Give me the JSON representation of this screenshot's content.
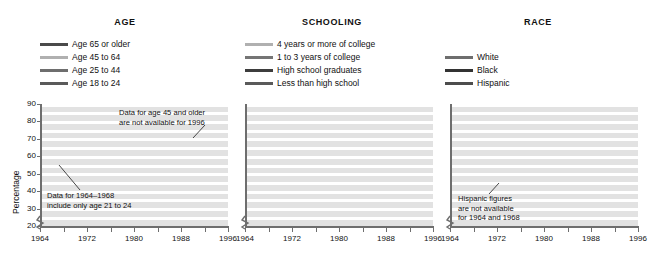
{
  "figure": {
    "ylabel": "Percentage",
    "yticks": [
      20,
      30,
      40,
      50,
      60,
      70,
      80,
      90
    ],
    "xticks": [
      1964,
      1968,
      1972,
      1976,
      1980,
      1984,
      1988,
      1992,
      1996
    ],
    "xtick_labels": [
      "1964",
      "",
      "1972",
      "",
      "1980",
      "",
      "1988",
      "",
      "1996"
    ],
    "colors": {
      "dark": "#444444",
      "darker": "#2e2e2e",
      "mid": "#6b6b6b",
      "light": "#a8a8a8",
      "lighter": "#bdbdbd",
      "plot_bg": "#e2e2e2",
      "gridline": "#ffffff",
      "axis": "#6e6e6e"
    }
  },
  "chart_data": [
    {
      "type": "line",
      "title": "AGE",
      "xlabel": "",
      "ylabel": "Percentage",
      "xlim": [
        1964,
        1996
      ],
      "ylim": [
        20,
        90
      ],
      "grid": true,
      "legend_position": "above-plot",
      "x": [
        1964,
        1968,
        1972,
        1976,
        1980,
        1984,
        1988,
        1992,
        1996
      ],
      "series": [
        {
          "name": "Age 65 or older",
          "color": "#4a4a4a",
          "values": [
            66,
            66,
            64,
            62,
            65,
            68,
            69,
            70,
            null
          ]
        },
        {
          "name": "Age 45 to 64",
          "color": "#b0b0b0",
          "values": [
            76,
            75,
            71,
            69,
            69,
            70,
            68,
            70,
            null
          ]
        },
        {
          "name": "Age 25 to 44",
          "color": "#6e6e6e",
          "values": [
            69,
            67,
            63,
            59,
            59,
            59,
            59,
            58,
            50
          ]
        },
        {
          "name": "Age 18 to 24",
          "color": "#5a5a5a",
          "values": [
            51,
            51,
            50,
            46,
            40,
            41,
            36,
            43,
            32
          ]
        }
      ],
      "annotations": [
        {
          "text": [
            "Data for age 45 and older",
            "are not available for 1996"
          ],
          "target": "Age 45 to 64 / 65 or older"
        },
        {
          "text": [
            "Data for 1964–1968",
            "include only age 21 to 24"
          ],
          "target": "Age 18 to 24"
        }
      ],
      "notes": "Age 18 to 24 data for 1964-1968 include only age 21 to 24; age 45 and older not available for 1996."
    },
    {
      "type": "line",
      "title": "SCHOOLING",
      "xlabel": "",
      "ylabel": "Percentage",
      "xlim": [
        1964,
        1996
      ],
      "ylim": [
        20,
        90
      ],
      "grid": true,
      "legend_position": "above-plot",
      "x": [
        1964,
        1968,
        1972,
        1976,
        1980,
        1984,
        1988,
        1992,
        1996
      ],
      "series": [
        {
          "name": "4 years or more of college",
          "color": "#b0b0b0",
          "values": [
            88,
            85,
            84,
            80,
            80,
            79,
            78,
            81,
            73
          ]
        },
        {
          "name": "1 to 3 years of college",
          "color": "#757575",
          "values": [
            83,
            76,
            72,
            69,
            67,
            68,
            65,
            69,
            61
          ]
        },
        {
          "name": "High school graduates",
          "color": "#3d3d3d",
          "values": [
            80,
            73,
            65,
            59,
            59,
            59,
            55,
            55,
            50
          ]
        },
        {
          "name": "Less than high school",
          "color": "#5a5a5a",
          "values": [
            66,
            61,
            53,
            47,
            43,
            43,
            40,
            36,
            30
          ]
        }
      ],
      "annotations": []
    },
    {
      "type": "line",
      "title": "RACE",
      "xlabel": "",
      "ylabel": "Percentage",
      "xlim": [
        1964,
        1996
      ],
      "ylim": [
        20,
        90
      ],
      "grid": true,
      "legend_position": "above-plot",
      "x": [
        1964,
        1968,
        1972,
        1976,
        1980,
        1984,
        1988,
        1992,
        1996
      ],
      "series": [
        {
          "name": "White",
          "color": "#6e6e6e",
          "values": [
            73,
            70,
            66,
            62,
            62,
            62,
            60,
            65,
            67
          ]
        },
        {
          "name": "Black",
          "color": "#333333",
          "values": [
            60,
            60,
            57,
            51,
            55,
            58,
            54,
            60,
            63
          ]
        },
        {
          "name": "Hispanic",
          "color": "#4d4d4d",
          "values": [
            null,
            null,
            40,
            38,
            33,
            35,
            32,
            31,
            39
          ]
        }
      ],
      "annotations": [
        {
          "text": [
            "Hispanic figures",
            "are not available",
            "for 1964 and 1968"
          ],
          "target": "Hispanic"
        }
      ]
    }
  ],
  "panels": [
    {
      "id": "age",
      "title": "AGE",
      "legend": [
        {
          "label": "Age 65 or older",
          "color": "#4a4a4a"
        },
        {
          "label": "Age 45 to 64",
          "color": "#b0b0b0"
        },
        {
          "label": "Age 25 to 44",
          "color": "#6e6e6e"
        },
        {
          "label": "Age 18 to 24",
          "color": "#5a5a5a"
        }
      ],
      "annotations": [
        {
          "lines": [
            "Data for age 45 and older",
            "are not available for 1996"
          ]
        },
        {
          "lines": [
            "Data for 1964–1968",
            "include only age 21 to 24"
          ]
        }
      ]
    },
    {
      "id": "schooling",
      "title": "SCHOOLING",
      "legend": [
        {
          "label": "4 years or more of college",
          "color": "#b0b0b0"
        },
        {
          "label": "1 to 3 years of college",
          "color": "#757575"
        },
        {
          "label": "High school graduates",
          "color": "#3d3d3d"
        },
        {
          "label": "Less than high school",
          "color": "#5a5a5a"
        }
      ],
      "annotations": []
    },
    {
      "id": "race",
      "title": "RACE",
      "legend": [
        {
          "label": "White",
          "color": "#6e6e6e"
        },
        {
          "label": "Black",
          "color": "#333333"
        },
        {
          "label": "Hispanic",
          "color": "#4d4d4d"
        }
      ],
      "annotations": [
        {
          "lines": [
            "Hispanic figures",
            "are not available",
            "for 1964 and 1968"
          ]
        }
      ]
    }
  ]
}
